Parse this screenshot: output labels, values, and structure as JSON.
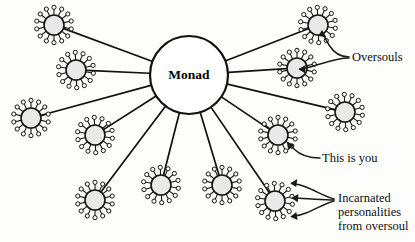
{
  "diagram": {
    "background_color": "#fdfdfc",
    "ink_color": "#111111",
    "node_fill_color": "#e9e9e9",
    "center": {
      "label": "Monad",
      "cx": 189,
      "cy": 75,
      "r": 39
    },
    "node_style": {
      "body_radius": 10,
      "spike_count": 14,
      "spike_length": 6.5,
      "spike_tip_radius": 2.1
    },
    "nodes": [
      {
        "id": "node-top-left",
        "cx": 54,
        "cy": 25,
        "role": "oversoul"
      },
      {
        "id": "node-upper-left",
        "cx": 76,
        "cy": 70,
        "role": "oversoul"
      },
      {
        "id": "node-far-left",
        "cx": 31,
        "cy": 118,
        "role": "oversoul"
      },
      {
        "id": "node-left-lower",
        "cx": 95,
        "cy": 135,
        "role": "oversoul"
      },
      {
        "id": "node-bottom-left",
        "cx": 95,
        "cy": 200,
        "role": "oversoul"
      },
      {
        "id": "node-bottom-center",
        "cx": 161,
        "cy": 185,
        "role": "oversoul"
      },
      {
        "id": "node-bottom-mid",
        "cx": 222,
        "cy": 185,
        "role": "oversoul"
      },
      {
        "id": "node-bottom-right",
        "cx": 275,
        "cy": 201,
        "role": "incarnated-personalities"
      },
      {
        "id": "node-right-you",
        "cx": 278,
        "cy": 135,
        "role": "this-is-you"
      },
      {
        "id": "node-far-right",
        "cx": 345,
        "cy": 112,
        "role": "oversoul"
      },
      {
        "id": "node-upper-right",
        "cx": 297,
        "cy": 68,
        "role": "oversoul-labeled"
      },
      {
        "id": "node-top-right",
        "cx": 318,
        "cy": 25,
        "role": "oversoul-labeled"
      }
    ],
    "labels": [
      {
        "id": "label-oversouls",
        "text": "Oversouls",
        "x": 352,
        "y": 61,
        "lines": [
          "Oversouls"
        ]
      },
      {
        "id": "label-this-is-you",
        "text": "This is you",
        "x": 322,
        "y": 162,
        "lines": [
          "This is you"
        ]
      },
      {
        "id": "label-incarnated",
        "text": "Incarnated personalities from oversoul",
        "x": 338,
        "y": 202,
        "lines": [
          "Incarnated",
          "personalities",
          "from oversoul"
        ]
      }
    ]
  }
}
